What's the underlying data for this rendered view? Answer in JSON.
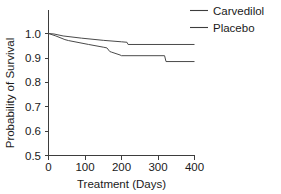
{
  "chart_data": {
    "type": "line",
    "title": "",
    "subtitle": "",
    "xlabel": "Treatment (Days)",
    "ylabel": "Probability of Survival",
    "xlim": [
      0,
      400
    ],
    "ylim": [
      0.5,
      1.02
    ],
    "xticks": [
      0,
      100,
      200,
      300,
      400
    ],
    "xtick_labels": [
      "0",
      "100",
      "200",
      "300",
      "400"
    ],
    "yticks": [
      0.5,
      0.6,
      0.7,
      0.8,
      0.9,
      1.0
    ],
    "ytick_labels": [
      "0.5",
      "0.6",
      "0.7",
      "0.8",
      "0.9",
      "1.0"
    ],
    "grid": false,
    "legend_position": "top-right",
    "series": [
      {
        "name": "Carvedilol",
        "color": "#3d3d3d",
        "x": [
          0,
          15,
          40,
          90,
          150,
          200,
          215,
          218,
          400
        ],
        "y": [
          1.0,
          0.998,
          0.99,
          0.981,
          0.972,
          0.966,
          0.964,
          0.955,
          0.955
        ]
      },
      {
        "name": "Placebo",
        "color": "#3d3d3d",
        "x": [
          0,
          20,
          45,
          55,
          110,
          150,
          160,
          168,
          172,
          196,
          200,
          318,
          322,
          400
        ],
        "y": [
          1.0,
          0.99,
          0.975,
          0.971,
          0.955,
          0.944,
          0.941,
          0.926,
          0.924,
          0.912,
          0.909,
          0.909,
          0.885,
          0.885
        ]
      }
    ]
  },
  "legend": {
    "entries": [
      {
        "label": "Carvedilol"
      },
      {
        "label": "Placebo"
      }
    ]
  },
  "axes": {
    "x_title": "Treatment (Days)",
    "y_title": "Probability of Survival"
  }
}
